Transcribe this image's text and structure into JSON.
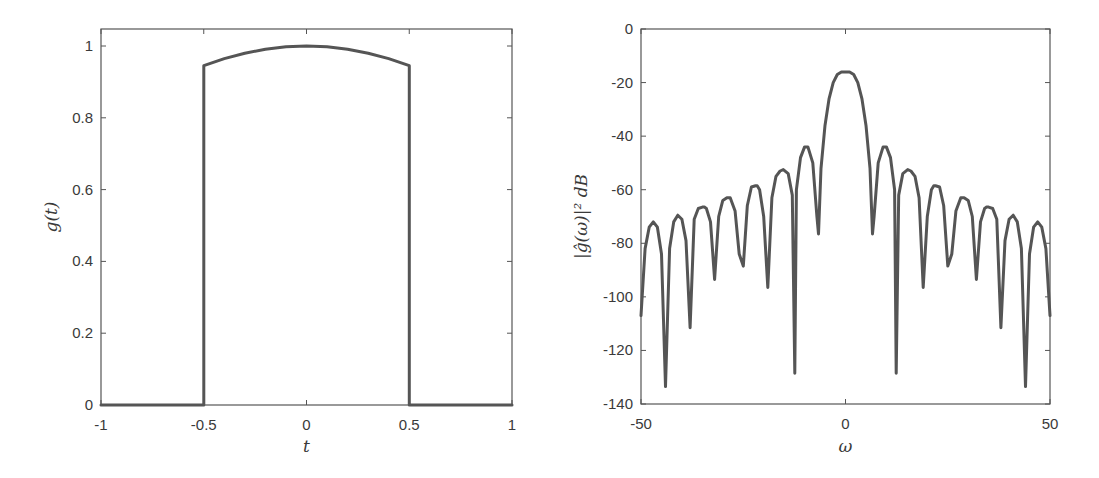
{
  "chart_data": [
    {
      "type": "line",
      "title": "",
      "xlabel": "t",
      "ylabel": "g(t)",
      "xlim": [
        -1,
        1
      ],
      "ylim": [
        0,
        1.05
      ],
      "xticks": [
        -1,
        -0.5,
        0,
        0.5,
        1
      ],
      "xtick_labels": [
        "-1",
        "-0.5",
        "0",
        "0.5",
        "1"
      ],
      "yticks": [
        0,
        0.2,
        0.4,
        0.6,
        0.8,
        1
      ],
      "ytick_labels": [
        "0",
        "0.2",
        "0.4",
        "0.6",
        "0.8",
        "1"
      ],
      "grid": false,
      "series": [
        {
          "name": "g(t)",
          "color": "#555555",
          "x": [
            -1,
            -0.5,
            -0.5,
            -0.4,
            -0.3,
            -0.2,
            -0.1,
            0,
            0.1,
            0.2,
            0.3,
            0.4,
            0.5,
            0.5,
            1
          ],
          "y": [
            0,
            0,
            0.945,
            0.965,
            0.98,
            0.991,
            0.998,
            1.0,
            0.998,
            0.991,
            0.98,
            0.965,
            0.945,
            0,
            0
          ]
        }
      ]
    },
    {
      "type": "line",
      "title": "",
      "xlabel": "ω",
      "ylabel": "|ĝ(ω)|² dB",
      "xlim": [
        -50,
        50
      ],
      "ylim": [
        -140,
        0
      ],
      "xticks": [
        -50,
        0,
        50
      ],
      "xtick_labels": [
        "-50",
        "0",
        "50"
      ],
      "yticks": [
        0,
        -20,
        -40,
        -60,
        -80,
        -100,
        -120,
        -140
      ],
      "ytick_labels": [
        "0",
        "-20",
        "-40",
        "-60",
        "-80",
        "-100",
        "-120",
        "-140"
      ],
      "grid": false,
      "series": [
        {
          "name": "|ĝ(ω)|² dB",
          "color": "#555555",
          "x": [
            -50,
            -49,
            -48,
            -47,
            -46,
            -45,
            -44,
            -43,
            -42,
            -41,
            -40,
            -39,
            -38,
            -37,
            -36,
            -35,
            -34.5,
            -34,
            -33,
            -32,
            -31,
            -30,
            -29,
            -28.2,
            -27,
            -26,
            -25,
            -24,
            -23,
            -22,
            -21.6,
            -21,
            -20,
            -19,
            -18,
            -17,
            -16,
            -15.2,
            -14,
            -13,
            -12.4,
            -12,
            -11,
            -10,
            -9.2,
            -8,
            -7,
            -6.6,
            -6,
            -5,
            -4,
            -3,
            -2,
            -1,
            0,
            1,
            2,
            3,
            4,
            5,
            6,
            6.6,
            7,
            8,
            9.2,
            10,
            11,
            12,
            12.4,
            13,
            14,
            15.2,
            16,
            17,
            18,
            19,
            20,
            21,
            21.6,
            22,
            23,
            24,
            25,
            26,
            27,
            28.2,
            29,
            30,
            31,
            32,
            33,
            34,
            34.5,
            35,
            36,
            37,
            38,
            39,
            40,
            41,
            42,
            43,
            44,
            45,
            46,
            47,
            48,
            49,
            50
          ],
          "y": [
            -107,
            -82,
            -74,
            -72,
            -74,
            -84,
            -133.5,
            -82,
            -72,
            -69.5,
            -71,
            -79,
            -111.5,
            -71,
            -67,
            -66.5,
            -66.5,
            -67,
            -72,
            -93.5,
            -70,
            -64,
            -63,
            -63,
            -68,
            -84,
            -88.5,
            -66,
            -59,
            -58.5,
            -58.5,
            -60,
            -70,
            -96.5,
            -63,
            -55,
            -53,
            -52.5,
            -54,
            -62,
            -128.5,
            -60,
            -48,
            -44,
            -44,
            -50,
            -70,
            -76.5,
            -52,
            -36,
            -26,
            -20,
            -17,
            -16,
            -16,
            -16,
            -17,
            -20,
            -26,
            -36,
            -52,
            -76.5,
            -70,
            -50,
            -44,
            -44,
            -48,
            -60,
            -128.5,
            -62,
            -54,
            -52.5,
            -53,
            -55,
            -63,
            -96.5,
            -70,
            -60,
            -58.5,
            -58.5,
            -59,
            -66,
            -88.5,
            -84,
            -68,
            -63,
            -63,
            -64,
            -70,
            -93.5,
            -72,
            -67,
            -66.5,
            -66.5,
            -67,
            -71,
            -111.5,
            -79,
            -71,
            -69.5,
            -72,
            -82,
            -133.5,
            -84,
            -74,
            -72,
            -74,
            -82,
            -107
          ]
        }
      ]
    }
  ]
}
